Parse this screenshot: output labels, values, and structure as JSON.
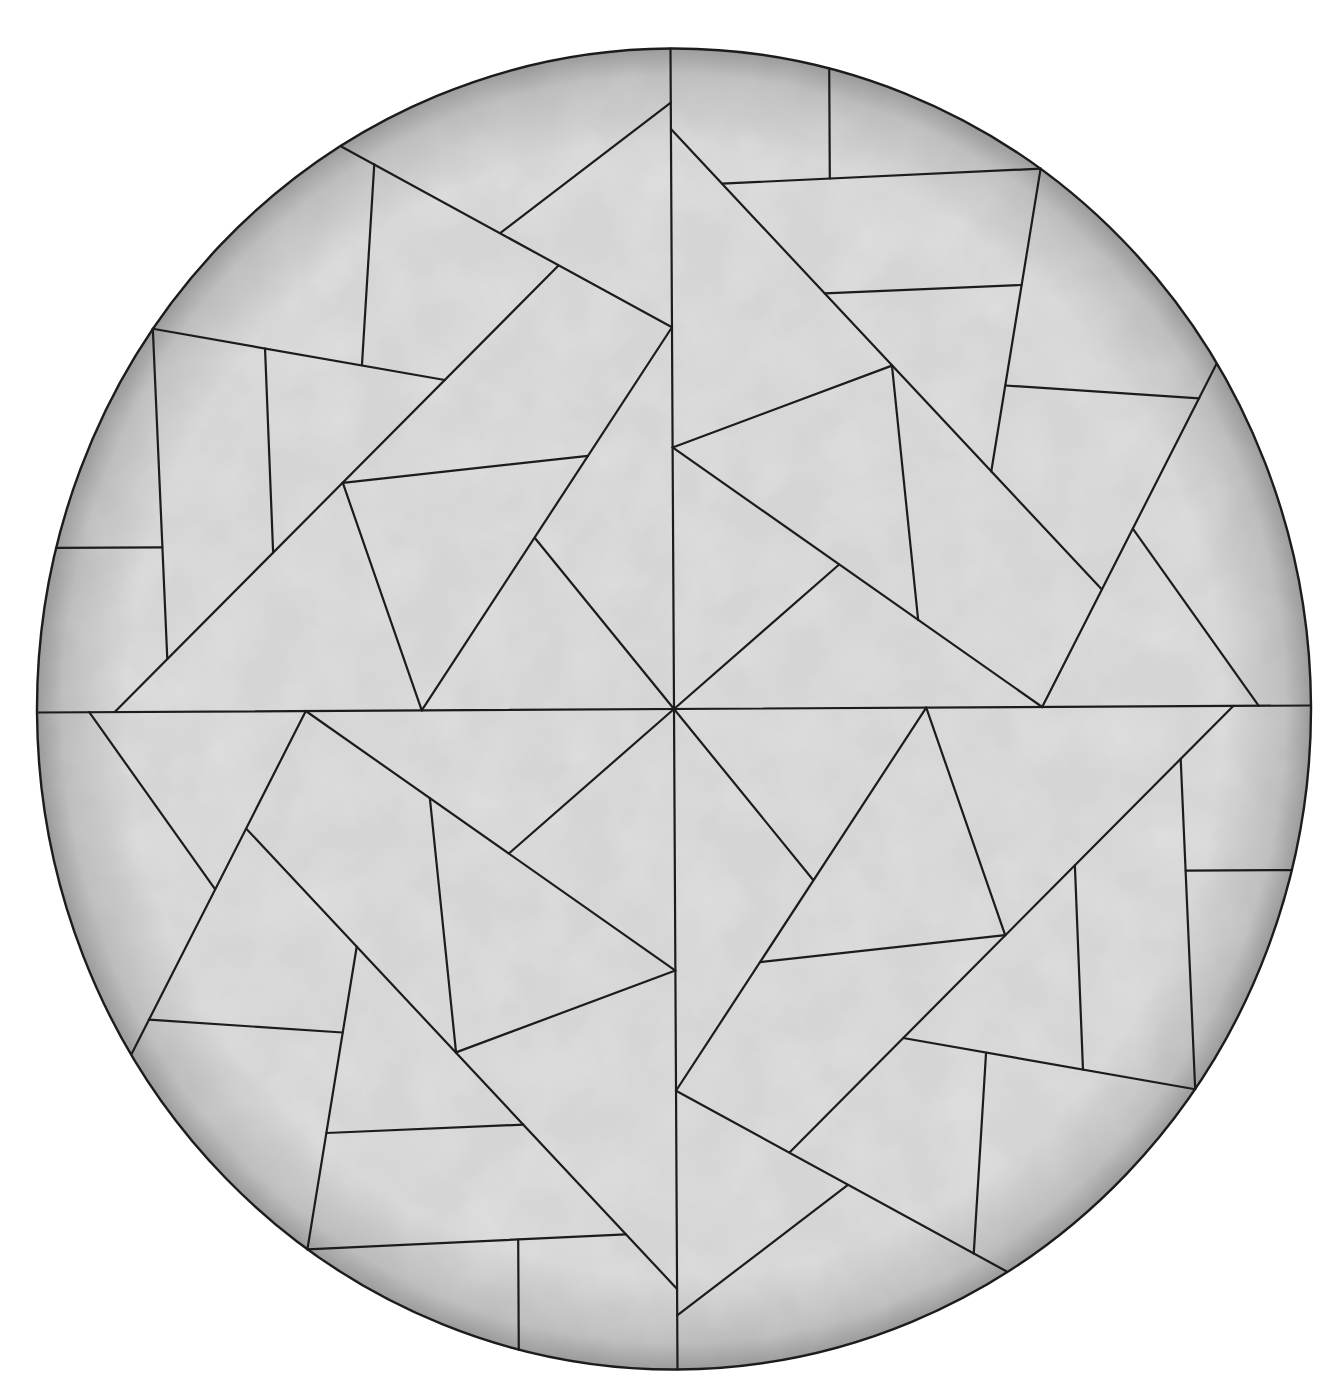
{
  "figure": {
    "canonical_radius": 1000,
    "screen_transform": {
      "a": 0.637,
      "b": -0.0035,
      "c": 0.0035,
      "d": 0.6605,
      "e": 674,
      "f": 709
    },
    "colors": {
      "background": "#ffffff",
      "fill_light": "#d6d6d6",
      "fill_mid": "#c4c4c4",
      "rim_shade": "#9c9c9c",
      "line": "#1c1c1c"
    },
    "axes": [
      {
        "name": "vertical-axis",
        "from": [
          0,
          -1000
        ],
        "to": [
          0,
          1000
        ]
      },
      {
        "name": "horizontal-axis",
        "from": [
          -1000,
          0
        ],
        "to": [
          1000,
          0
        ]
      }
    ],
    "quadrant_rotations": [
      {
        "name": "top-left",
        "m": [
          1,
          0,
          0,
          1
        ]
      },
      {
        "name": "top-right",
        "m": [
          0,
          -1,
          1,
          0
        ]
      },
      {
        "name": "bottom-right",
        "m": [
          -1,
          0,
          0,
          -1
        ]
      },
      {
        "name": "bottom-left",
        "m": [
          0,
          1,
          -1,
          0
        ]
      }
    ],
    "base_segments": [
      {
        "from": [
          0,
          -918
        ],
        "to": [
          -269,
          -722
        ]
      },
      {
        "from": [
          -517,
          -854
        ],
        "to": [
          0,
          -578
        ]
      },
      {
        "from": [
          -466,
          -827
        ],
        "to": [
          -487,
          -523
        ]
      },
      {
        "from": [
          -815,
          -580
        ],
        "to": [
          -357,
          -500
        ]
      },
      {
        "from": [
          -815,
          -580
        ],
        "to": [
          -795,
          -80
        ]
      },
      {
        "from": [
          -178,
          -672
        ],
        "to": [
          -878,
          0
        ]
      },
      {
        "from": [
          -639,
          -549
        ],
        "to": [
          -628,
          -240
        ]
      },
      {
        "from": [
          -969,
          -249
        ],
        "to": [
          -802,
          -249
        ]
      },
      {
        "from": [
          0,
          -578
        ],
        "to": [
          -396,
          0
        ]
      },
      {
        "from": [
          -518,
          -345
        ],
        "to": [
          -133,
          -384
        ]
      },
      {
        "from": [
          -518,
          -345
        ],
        "to": [
          -396,
          0
        ]
      },
      {
        "from": [
          -217,
          -260
        ],
        "to": [
          0,
          0
        ]
      }
    ]
  }
}
